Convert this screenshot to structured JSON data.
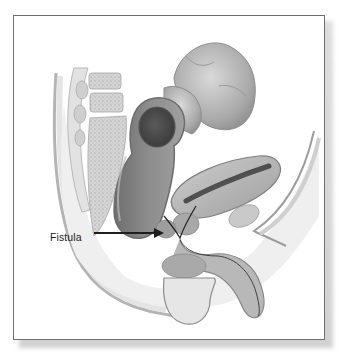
{
  "illustration": {
    "subject": "sagittal cross-section of male pelvis showing rectum, colon, bladder and prostate",
    "labels": [
      {
        "text": "Fistula",
        "points_to": "fistula-tract"
      }
    ]
  },
  "colors": {
    "frame_border": "#6f6f6f",
    "background": "#ffffff",
    "label_text": "#222222",
    "arrow": "#1e1e1e"
  }
}
